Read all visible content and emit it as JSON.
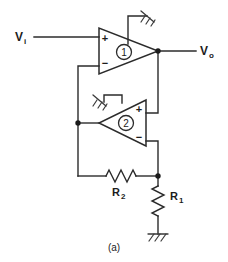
{
  "figure": {
    "caption": "(a)",
    "type": "circuit-schematic",
    "colors": {
      "background": "#ffffff",
      "wire": "#2b2b2b",
      "node": "#1c1c1c",
      "text": "#1c1c1c"
    }
  },
  "terminals": {
    "input": {
      "symbol": "V",
      "subscript": "i"
    },
    "output": {
      "symbol": "V",
      "subscript": "o"
    }
  },
  "opamps": [
    {
      "id": "opamp-1",
      "number": "1",
      "orientation": "right",
      "plus_pin": "+",
      "minus_pin": "−",
      "plus_position": "top",
      "minus_position": "bottom",
      "has_ground_pin": true
    },
    {
      "id": "opamp-2",
      "number": "2",
      "orientation": "left",
      "plus_pin": "+",
      "minus_pin": "−",
      "plus_position": "top",
      "minus_position": "bottom",
      "has_ground_pin": true
    }
  ],
  "resistors": [
    {
      "id": "resistor-r2",
      "symbol": "R",
      "subscript": "2",
      "orientation": "horizontal"
    },
    {
      "id": "resistor-r1",
      "symbol": "R",
      "subscript": "1",
      "orientation": "vertical"
    }
  ],
  "grounds": [
    {
      "id": "ground-opamp-1",
      "style": "hatched"
    },
    {
      "id": "ground-opamp-2",
      "style": "hatched"
    },
    {
      "id": "ground-r1",
      "style": "hatched"
    }
  ]
}
